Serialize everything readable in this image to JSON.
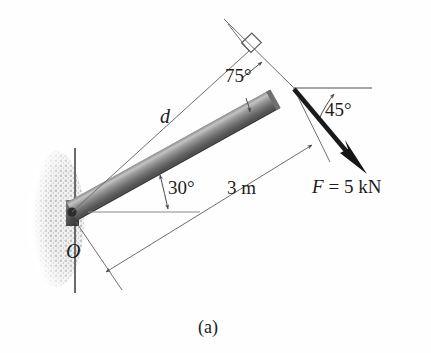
{
  "figure": {
    "caption": "(a)",
    "labels": {
      "angle_beam_horizontal": "30°",
      "angle_perpendicular": "75°",
      "angle_force_horizontal": "45°",
      "length_beam": "3 m",
      "moment_arm": "d",
      "pivot_point": "O",
      "force_magnitude": "F = 5 kN",
      "force_symbol": "F",
      "force_value": "= 5 kN"
    },
    "colors": {
      "beam_dark": "#4a4a4a",
      "beam_mid": "#7d7d7d",
      "beam_light": "#b9b9b9",
      "line": "#555555",
      "force_arrow": "#1a1a1a",
      "wall_hatch": "#c9c9c9",
      "text": "#1c1c1c",
      "background": "#ffffff"
    },
    "geometry": {
      "pivot": [
        70,
        212
      ],
      "beam_tip": [
        294,
        88
      ],
      "force_arrow_tip": [
        366,
        173
      ],
      "beam_angle_deg": 30,
      "force_angle_deg": 45,
      "perpendicular_angle_deg": 75,
      "beam_length_m": 3,
      "force_kN": 5
    }
  }
}
